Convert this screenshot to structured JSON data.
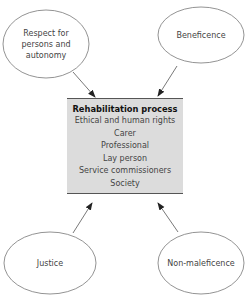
{
  "diagram": {
    "central_box": {
      "title": "Rehabilitation process",
      "items": [
        "Ethical and human rights",
        "Carer",
        "Professional",
        "Lay person",
        "Service commissioners",
        "Society"
      ]
    },
    "principles": {
      "top_left": "Respect for persons and autonomy",
      "top_right": "Beneficence",
      "bottom_left": "Justice",
      "bottom_right": "Non-maleficence"
    },
    "colors": {
      "box_fill": "#dcdcdc",
      "line": "#555555"
    }
  }
}
